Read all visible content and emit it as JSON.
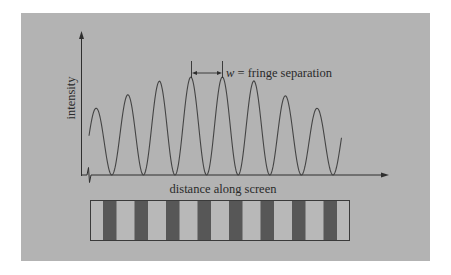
{
  "figure": {
    "y_axis_label": "intensity",
    "x_axis_label": "distance along screen",
    "annotation": {
      "symbol": "w",
      "text": " = fringe separation"
    },
    "colors": {
      "panel": "#b3b3b3",
      "line": "#3a3a3a",
      "dark_fringe": "#575757",
      "light_fringe": "#b8b8b8"
    },
    "fringe_count_dark": 8
  },
  "chart_data": {
    "type": "line",
    "title": "",
    "xlabel": "distance along screen",
    "ylabel": "intensity",
    "peaks": {
      "x_px": [
        96,
        128,
        160,
        191,
        223,
        254,
        285,
        317
      ],
      "relative_height": [
        0.68,
        0.82,
        0.96,
        1.0,
        1.0,
        0.96,
        0.81,
        0.68
      ]
    },
    "minima_x_px": [
      112,
      143,
      175,
      207,
      238,
      270,
      302,
      333
    ],
    "fringe_separation_px": 31.6,
    "grid": false
  }
}
